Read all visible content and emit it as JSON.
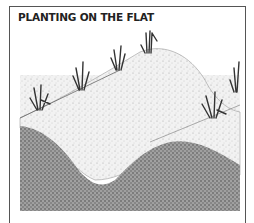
{
  "figure": {
    "title": "PLANTING ON THE FLAT",
    "colors": {
      "border": "#555555",
      "soil_light": "#e6e6e6",
      "soil_dark": "#8a8a8a",
      "plant": "#333333"
    }
  }
}
